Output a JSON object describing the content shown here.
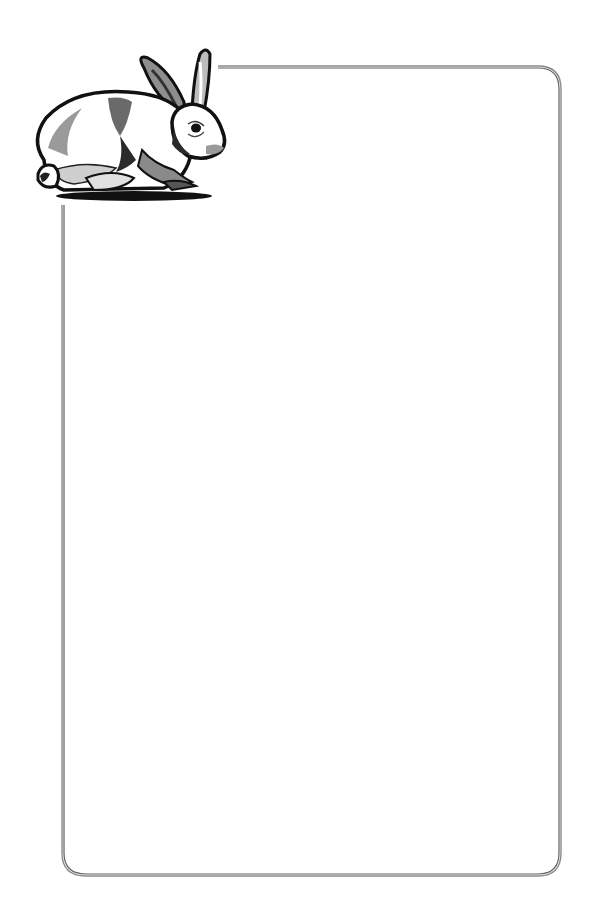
{
  "page": {
    "type": "decorative-stationery-border",
    "background_color": "#ffffff"
  },
  "frame": {
    "style": "double-line rounded rectangle",
    "line_color": "#808080",
    "inner_line_color": "#5a5a5a",
    "corner_radius": 22,
    "left": 63,
    "top": 67,
    "right": 560,
    "bottom": 875,
    "top_line_starts_at_x": 218,
    "left_line_starts_at_y": 205
  },
  "illustration": {
    "subject": "rabbit-icon",
    "style": "grayscale woodcut clip art",
    "position": "top-left corner, overlapping frame",
    "colors": {
      "outline": "#111111",
      "shade_dark": "#5a5a5a",
      "shade_mid": "#9a9a9a",
      "shade_light": "#cfcfcf",
      "fur": "#ffffff"
    }
  },
  "writing_area": {
    "content": ""
  }
}
